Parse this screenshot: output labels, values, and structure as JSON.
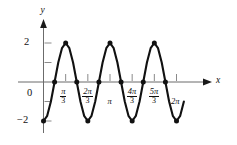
{
  "figure": {
    "name": "trigonometric-graph"
  },
  "axes": {
    "x_axis_label": "x",
    "y_axis_label": "y",
    "origin_label": "0",
    "y_top_label": "2",
    "y_bottom_label": "−2"
  },
  "x_ticks": [
    {
      "value": 0,
      "label": "0",
      "type": "plain"
    },
    {
      "value": 1.0472,
      "label": "π/3",
      "numerator": "π",
      "denominator": "3",
      "type": "fraction"
    },
    {
      "value": 2.0944,
      "label": "2π/3",
      "numerator": "2π",
      "denominator": "3",
      "type": "fraction"
    },
    {
      "value": 3.1416,
      "label": "π",
      "type": "plain-pi"
    },
    {
      "value": 4.1888,
      "label": "4π/3",
      "numerator": "4π",
      "denominator": "3",
      "type": "fraction"
    },
    {
      "value": 5.236,
      "label": "5π/3",
      "numerator": "5π",
      "denominator": "3",
      "type": "fraction"
    },
    {
      "value": 6.2832,
      "label": "2π",
      "type": "plain-pi"
    }
  ],
  "y_ticks": [
    {
      "value": 2,
      "label": "2"
    },
    {
      "value": 1,
      "label": ""
    },
    {
      "value": -1,
      "label": ""
    },
    {
      "value": -2,
      "label": "−2"
    }
  ],
  "colors": {
    "curve": "#111111",
    "axis": "#6b6b6b",
    "marker": "#111111",
    "background": "#ffffff"
  },
  "chart_data": {
    "type": "line",
    "title": "",
    "xlabel": "x",
    "ylabel": "y",
    "xlim": [
      -0.35,
      6.95
    ],
    "ylim": [
      -2.45,
      2.45
    ],
    "grid": false,
    "legend": false,
    "function": "y = -2cos(3x)",
    "amplitude": 2,
    "period": 2.0944,
    "series": [
      {
        "name": "y = -2cos(3x)",
        "x": [
          0,
          0.1745,
          0.3491,
          0.5236,
          0.6981,
          0.8727,
          1.0472,
          1.2217,
          1.3963,
          1.5708,
          1.7453,
          1.9199,
          2.0944,
          2.2689,
          2.4435,
          2.618,
          2.7925,
          2.9671,
          3.1416,
          3.3161,
          3.4907,
          3.6652,
          3.8397,
          4.0143,
          4.1888,
          4.3633,
          4.5379,
          4.7124,
          4.8869,
          5.0615,
          5.236,
          5.4105,
          5.5851,
          5.7596,
          5.9341,
          6.1087,
          6.2832,
          6.4577,
          6.6323
        ],
        "y": [
          -2,
          -1.732,
          -1,
          0,
          1,
          1.732,
          2,
          1.732,
          1,
          0,
          -1,
          -1.732,
          -2,
          -1.732,
          -1,
          0,
          1,
          1.732,
          2,
          1.732,
          1,
          0,
          -1,
          -1.732,
          -2,
          -1.732,
          -1,
          0,
          1,
          1.732,
          2,
          1.732,
          1,
          0,
          -1,
          -1.732,
          -2,
          -1.732,
          -1
        ]
      }
    ],
    "markers": [
      {
        "x": 0,
        "y": -2,
        "kind": "minimum"
      },
      {
        "x": 0.5236,
        "y": 0,
        "kind": "zero-crossing"
      },
      {
        "x": 1.0472,
        "y": 2,
        "kind": "maximum"
      },
      {
        "x": 1.5708,
        "y": 0,
        "kind": "zero-crossing"
      },
      {
        "x": 2.0944,
        "y": -2,
        "kind": "minimum"
      },
      {
        "x": 2.618,
        "y": 0,
        "kind": "zero-crossing"
      },
      {
        "x": 3.1416,
        "y": 2,
        "kind": "maximum"
      },
      {
        "x": 3.6652,
        "y": 0,
        "kind": "zero-crossing"
      },
      {
        "x": 4.1888,
        "y": -2,
        "kind": "minimum"
      },
      {
        "x": 4.7124,
        "y": 0,
        "kind": "zero-crossing"
      },
      {
        "x": 5.236,
        "y": 2,
        "kind": "maximum"
      },
      {
        "x": 5.7596,
        "y": 0,
        "kind": "zero-crossing"
      },
      {
        "x": 6.2832,
        "y": -2,
        "kind": "minimum"
      }
    ]
  }
}
